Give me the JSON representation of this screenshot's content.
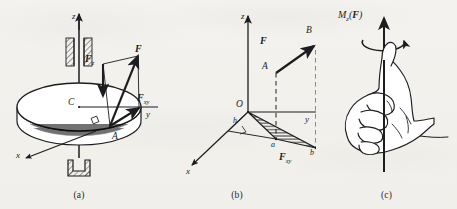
{
  "figure": {
    "background_color": "#f3f2ee",
    "ink_color": "#1d1d20",
    "panel_captions": [
      "(a)",
      "(b)",
      "(c)"
    ]
  },
  "panel_a": {
    "caption": "(a)",
    "description": "Disc on a vertical shaft held in a journal bearing above and a thrust bearing below; force F applied at rim point A is resolved into vertical component Fz and horizontal component Fxy.",
    "axis_z": "z",
    "axis_x": "x",
    "axis_y": "y",
    "center_point": "C",
    "application_point": "A",
    "force": "F",
    "force_sub": "",
    "component_vertical": "F",
    "component_vertical_sub": "z",
    "component_horizontal": "F",
    "component_horizontal_sub": "xy"
  },
  "panel_b": {
    "caption": "(b)",
    "description": "Coordinate frame Oxyz. Force F acts from A to B in a vertical plane; its horizontal projection Fxy runs from a to b and the shaded triangle Oab has altitude h from O.",
    "axis_z": "z",
    "axis_x": "x",
    "axis_y": "y",
    "origin": "O",
    "point_A": "A",
    "point_B": "B",
    "point_a": "a",
    "point_b": "b",
    "moment_arm": "h",
    "force": "F",
    "projection": "F",
    "projection_sub": "xy",
    "right_angle_marker": true,
    "shaded_triangle": "Oab"
  },
  "panel_c": {
    "caption": "(c)",
    "description": "Right-hand rule: fingers curl in the sense of rotation while the extended thumb points along the positive moment vector.",
    "moment_label_main": "M",
    "moment_label_sub": "z",
    "moment_label_arg_open": "(",
    "moment_label_force": "F",
    "moment_label_arg_close": ")",
    "rotation_sense": "counterclockwise-about-z",
    "hand": "right-hand-thumb-up"
  }
}
